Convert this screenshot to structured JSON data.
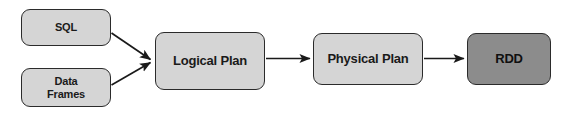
{
  "diagram": {
    "background_color": "#ffffff",
    "node_fill_light": "#d5d5d5",
    "node_fill_dark": "#8c8c8c",
    "node_stroke": "#2b2b2b",
    "edge_color": "#1a1a1a",
    "nodes": [
      {
        "id": "sql",
        "label": "SQL",
        "shape": "rounded-rect",
        "style": "light"
      },
      {
        "id": "dataframes",
        "label": "Data\nFrames",
        "shape": "rounded-rect",
        "style": "light"
      },
      {
        "id": "logical-plan",
        "label": "Logical Plan",
        "shape": "rounded-rect",
        "style": "light"
      },
      {
        "id": "physical-plan",
        "label": "Physical Plan",
        "shape": "rounded-rect",
        "style": "light"
      },
      {
        "id": "rdd",
        "label": "RDD",
        "shape": "rounded-rect",
        "style": "dark"
      }
    ],
    "edges": [
      {
        "id": "edge-sql-to-logical",
        "from": "sql",
        "to": "logical-plan",
        "arrowhead": "filled-triangle"
      },
      {
        "id": "edge-dataframes-to-logical",
        "from": "dataframes",
        "to": "logical-plan",
        "arrowhead": "filled-triangle"
      },
      {
        "id": "edge-logical-to-physical",
        "from": "logical-plan",
        "to": "physical-plan",
        "arrowhead": "filled-triangle"
      },
      {
        "id": "edge-physical-to-rdd",
        "from": "physical-plan",
        "to": "rdd",
        "arrowhead": "filled-triangle"
      }
    ]
  }
}
